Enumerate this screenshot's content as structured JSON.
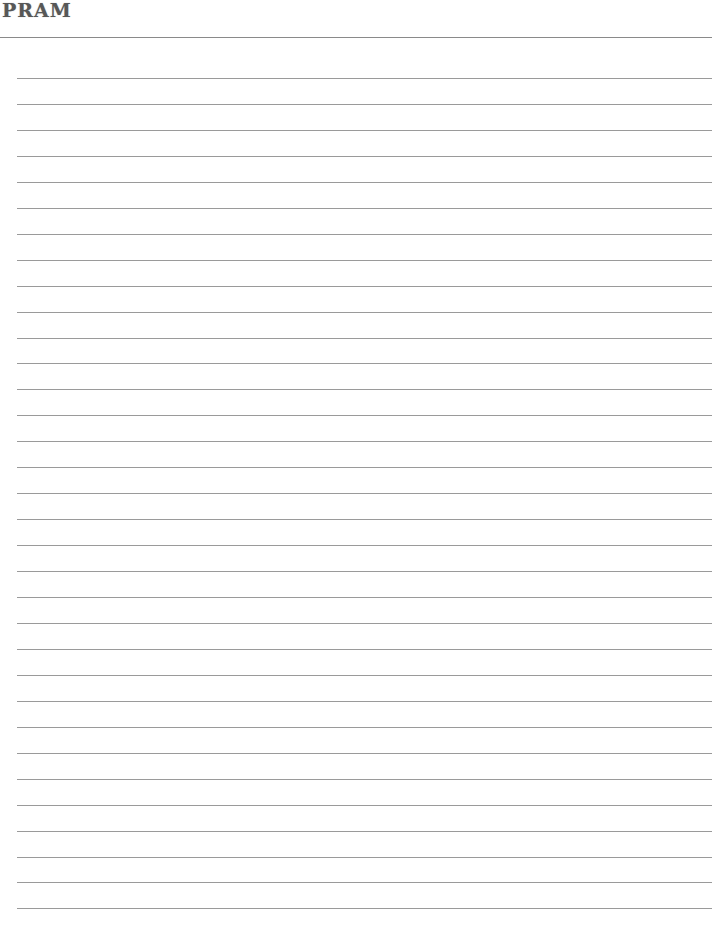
{
  "header": {
    "logo_text": "PRAM"
  },
  "page": {
    "type": "lined-paper",
    "line_count": 33,
    "first_line_y": 78,
    "line_spacing": 26,
    "line_color": "#9a9a9a"
  }
}
